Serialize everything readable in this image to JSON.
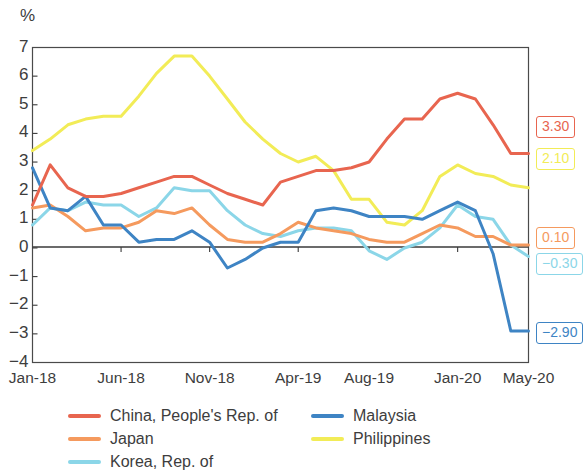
{
  "axis": {
    "unit_label": "%",
    "y_ticks": [
      "7",
      "6",
      "5",
      "4",
      "3",
      "2",
      "1",
      "0",
      "-1",
      "-2",
      "-3",
      "-4"
    ],
    "x_ticks": [
      "Jan-18",
      "Jun-18",
      "Nov-18",
      "Apr-19",
      "Aug-19",
      "Jan-20",
      "May-20"
    ]
  },
  "end_labels": [
    {
      "name": "china-end-value",
      "text": "3.30",
      "color": "#E8654F"
    },
    {
      "name": "philippines-end-value",
      "text": "2.10",
      "color": "#F2EC57"
    },
    {
      "name": "japan-end-value",
      "text": "0.10",
      "color": "#F59A5E"
    },
    {
      "name": "korea-end-value",
      "text": "-0.30",
      "color": "#8BD6E8"
    },
    {
      "name": "malaysia-end-value",
      "text": "-2.90",
      "color": "#3E84C4"
    }
  ],
  "legend": {
    "left_items": [
      {
        "label": "China, People's Rep. of",
        "color": "#E8654F"
      },
      {
        "label": "Japan",
        "color": "#F59A5E"
      },
      {
        "label": "Korea, Rep. of",
        "color": "#8BD6E8"
      }
    ],
    "right_items": [
      {
        "label": "Malaysia",
        "color": "#3E84C4"
      },
      {
        "label": "Philippines",
        "color": "#F2EC57"
      }
    ]
  },
  "chart_data": {
    "type": "line",
    "title": "",
    "xlabel": "",
    "ylabel": "%",
    "ylim": [
      -4,
      7
    ],
    "grid": false,
    "legend_position": "bottom",
    "x": [
      "Jan-18",
      "Feb-18",
      "Mar-18",
      "Apr-18",
      "May-18",
      "Jun-18",
      "Jul-18",
      "Aug-18",
      "Sep-18",
      "Oct-18",
      "Nov-18",
      "Dec-18",
      "Jan-19",
      "Feb-19",
      "Mar-19",
      "Apr-19",
      "May-19",
      "Jun-19",
      "Jul-19",
      "Aug-19",
      "Sep-19",
      "Oct-19",
      "Nov-19",
      "Dec-19",
      "Jan-20",
      "Feb-20",
      "Mar-20",
      "Apr-20",
      "May-20"
    ],
    "series": [
      {
        "name": "China, People's Rep. of",
        "color": "#E8654F",
        "values": [
          1.5,
          2.9,
          2.1,
          1.8,
          1.8,
          1.9,
          2.1,
          2.3,
          2.5,
          2.5,
          2.2,
          1.9,
          1.7,
          1.5,
          2.3,
          2.5,
          2.7,
          2.7,
          2.8,
          3.0,
          3.8,
          4.5,
          4.5,
          5.2,
          5.4,
          5.2,
          4.3,
          3.3,
          3.3
        ]
      },
      {
        "name": "Japan",
        "color": "#F59A5E",
        "values": [
          1.4,
          1.5,
          1.1,
          0.6,
          0.7,
          0.7,
          0.9,
          1.3,
          1.2,
          1.4,
          0.8,
          0.3,
          0.2,
          0.2,
          0.5,
          0.9,
          0.7,
          0.6,
          0.5,
          0.3,
          0.2,
          0.2,
          0.5,
          0.8,
          0.7,
          0.4,
          0.4,
          0.1,
          0.1
        ]
      },
      {
        "name": "Korea, Rep. of",
        "color": "#8BD6E8",
        "values": [
          0.8,
          1.4,
          1.3,
          1.6,
          1.5,
          1.5,
          1.1,
          1.4,
          2.1,
          2.0,
          2.0,
          1.3,
          0.8,
          0.5,
          0.4,
          0.6,
          0.7,
          0.7,
          0.6,
          -0.1,
          -0.4,
          0.0,
          0.2,
          0.7,
          1.5,
          1.1,
          1.0,
          0.1,
          -0.3
        ]
      },
      {
        "name": "Malaysia",
        "color": "#3E84C4",
        "values": [
          2.8,
          1.4,
          1.3,
          1.8,
          0.8,
          0.8,
          0.2,
          0.3,
          0.3,
          0.6,
          0.2,
          -0.7,
          -0.4,
          0.0,
          0.2,
          0.2,
          1.3,
          1.4,
          1.3,
          1.1,
          1.1,
          1.1,
          1.0,
          1.3,
          1.6,
          1.3,
          -0.2,
          -2.9,
          -2.9
        ]
      },
      {
        "name": "Philippines",
        "color": "#F2EC57",
        "values": [
          3.4,
          3.8,
          4.3,
          4.5,
          4.6,
          4.6,
          5.3,
          6.1,
          6.7,
          6.7,
          6.0,
          5.2,
          4.4,
          3.8,
          3.3,
          3.0,
          3.2,
          2.7,
          1.7,
          1.7,
          0.9,
          0.8,
          1.3,
          2.5,
          2.9,
          2.6,
          2.5,
          2.2,
          2.1
        ]
      }
    ]
  }
}
